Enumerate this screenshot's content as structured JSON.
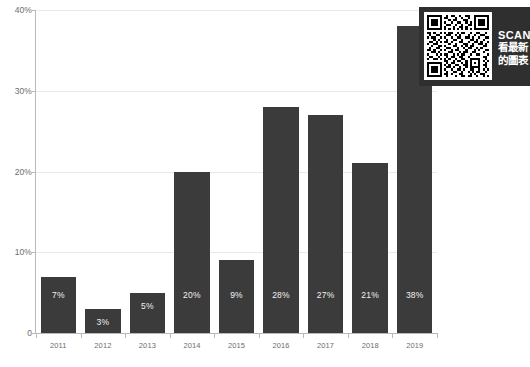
{
  "chart_data": {
    "type": "bar",
    "title": "",
    "subtitle": "",
    "xlabel": "",
    "ylabel": "",
    "categories": [
      "2011",
      "2012",
      "2013",
      "2014",
      "2015",
      "2016",
      "2017",
      "2018",
      "2019"
    ],
    "values": [
      7,
      3,
      5,
      20,
      9,
      28,
      27,
      21,
      38
    ],
    "data_labels": [
      "7%",
      "3%",
      "5%",
      "20%",
      "9%",
      "28%",
      "27%",
      "21%",
      "38%"
    ],
    "ylim": [
      0,
      40
    ],
    "y_ticks": [
      0,
      10,
      20,
      30,
      40
    ],
    "y_tick_labels": [
      "0",
      "10%",
      "20%",
      "30%",
      "40%"
    ],
    "grid": true,
    "grid_axis": "y",
    "legend": false,
    "legend_position": "none",
    "series": [
      {
        "name": "",
        "values": [
          7,
          3,
          5,
          20,
          9,
          28,
          27,
          21,
          38
        ],
        "color": "#3b3b3b"
      }
    ]
  },
  "colors": {
    "bar": "#3b3b3b",
    "bar_label": "#f2f2f2",
    "gridline": "#e9e9e9",
    "axis": "#b9b9b9",
    "tick_text": "#6d6d6d",
    "panel_background": "#2f2f2f",
    "page_background": "#ffffff"
  },
  "qr_panel": {
    "scan_label": "SCAN",
    "line_cn_1": "看最新",
    "line_cn_2": "的圖表",
    "qr_icon": "qr-code-icon"
  }
}
